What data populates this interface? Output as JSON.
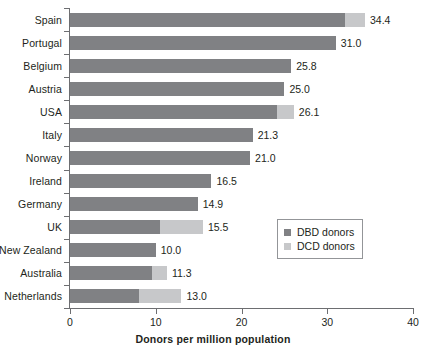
{
  "chart_data": {
    "type": "bar",
    "orientation": "horizontal",
    "stacked": true,
    "title": "",
    "xlabel": "Donors per million population",
    "ylabel": "",
    "xlim": [
      0,
      40
    ],
    "xticks": [
      0,
      10,
      20,
      30,
      40
    ],
    "grid": false,
    "legend_position": "inside-right-middle",
    "categories": [
      "Spain",
      "Portugal",
      "Belgium",
      "Austria",
      "USA",
      "Italy",
      "Norway",
      "Ireland",
      "Germany",
      "UK",
      "New Zealand",
      "Australia",
      "Netherlands"
    ],
    "series": [
      {
        "name": "DBD donors",
        "color": "#808184",
        "values": [
          32.1,
          31.0,
          25.8,
          25.0,
          24.1,
          21.3,
          21.0,
          16.5,
          14.9,
          10.5,
          10.0,
          9.6,
          8.0
        ]
      },
      {
        "name": "DCD donors",
        "color": "#c7c8ca",
        "values": [
          2.3,
          0.0,
          0.0,
          0.0,
          2.0,
          0.0,
          0.0,
          0.0,
          0.0,
          5.0,
          0.0,
          1.7,
          5.0
        ]
      }
    ],
    "totals": [
      34.4,
      31.0,
      25.8,
      25.0,
      26.1,
      21.3,
      21.0,
      16.5,
      14.9,
      15.5,
      10.0,
      11.3,
      13.0
    ],
    "data_labels": [
      "34.4",
      "31.0",
      "25.8",
      "25.0",
      "26.1",
      "21.3",
      "21.0",
      "16.5",
      "14.9",
      "15.5",
      "10.0",
      "11.3",
      "13.0"
    ],
    "xtick_labels": [
      "0",
      "10",
      "20",
      "30",
      "40"
    ],
    "legend": [
      {
        "label": "DBD donors",
        "color": "#808184"
      },
      {
        "label": "DCD donors",
        "color": "#c7c8ca"
      }
    ]
  }
}
